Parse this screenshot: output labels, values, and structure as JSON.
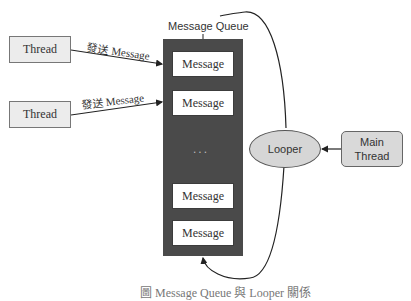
{
  "diagram": {
    "threads": [
      {
        "label": "Thread"
      },
      {
        "label": "Thread"
      }
    ],
    "send_labels": [
      "發送 Message",
      "發送 Message"
    ],
    "queue": {
      "title": "Message Queue",
      "messages": [
        "Message",
        "Message",
        "Message",
        "Message"
      ],
      "ellipsis": "..."
    },
    "looper": {
      "label": "Looper"
    },
    "main_thread": {
      "line1": "Main",
      "line2": "Thread"
    },
    "caption": "圖 Message Queue 與 Looper 關係"
  }
}
